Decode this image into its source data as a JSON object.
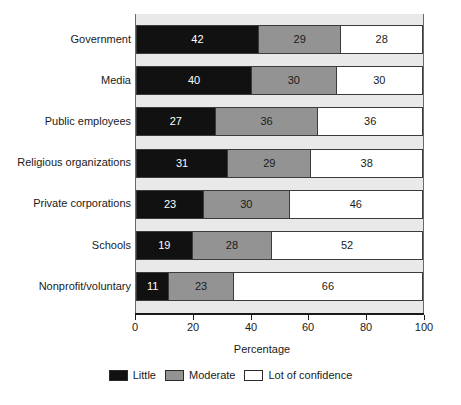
{
  "chart_data": {
    "type": "bar",
    "orientation": "horizontal",
    "stacked": true,
    "stack_mode": "percent",
    "title": "",
    "subtitle": "",
    "xlabel": "Percentage",
    "ylabel": "",
    "xlim": [
      0,
      100
    ],
    "xticks": [
      0,
      20,
      40,
      60,
      80,
      100
    ],
    "xtick_labels": [
      "0",
      "20",
      "40",
      "60",
      "80",
      "100"
    ],
    "grid": false,
    "legend_position": "bottom",
    "categories": [
      "Government",
      "Media",
      "Public employees",
      "Religious organizations",
      "Private corporations",
      "Schools",
      "Nonprofit/voluntary"
    ],
    "series": [
      {
        "name": "Little",
        "color": "#111111",
        "values": [
          42,
          40,
          27,
          31,
          23,
          19,
          11
        ]
      },
      {
        "name": "Moderate",
        "color": "#939393",
        "values": [
          29,
          30,
          36,
          29,
          30,
          28,
          23
        ]
      },
      {
        "name": "Lot of confidence",
        "color": "#ffffff",
        "values": [
          28,
          30,
          36,
          38,
          46,
          52,
          66
        ]
      }
    ],
    "rows": [
      {
        "category": "Government",
        "little": 42,
        "moderate": 29,
        "lot": 28
      },
      {
        "category": "Media",
        "little": 40,
        "moderate": 30,
        "lot": 30
      },
      {
        "category": "Public employees",
        "little": 27,
        "moderate": 36,
        "lot": 36
      },
      {
        "category": "Religious organizations",
        "little": 31,
        "moderate": 29,
        "lot": 38
      },
      {
        "category": "Private corporations",
        "little": 23,
        "moderate": 30,
        "lot": 46
      },
      {
        "category": "Schools",
        "little": 19,
        "moderate": 28,
        "lot": 52
      },
      {
        "category": "Nonprofit/voluntary",
        "little": 11,
        "moderate": 23,
        "lot": 66
      }
    ]
  },
  "legend": {
    "items": [
      {
        "label": "Little",
        "color": "#111111"
      },
      {
        "label": "Moderate",
        "color": "#939393"
      },
      {
        "label": "Lot of confidence",
        "color": "#ffffff"
      }
    ]
  },
  "axis": {
    "x_title": "Percentage",
    "tick_labels": [
      "0",
      "20",
      "40",
      "60",
      "80",
      "100"
    ]
  },
  "colors": {
    "little": "#111111",
    "moderate": "#939393",
    "lot": "#ffffff",
    "plot_background": "#e9e9e9",
    "outline": "#3b3b3b",
    "text": "#1a1a1a"
  }
}
